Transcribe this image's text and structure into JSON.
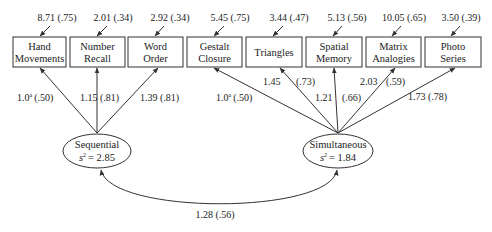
{
  "diagram": {
    "type": "structural-equation-model",
    "colors": {
      "stroke": "#333333",
      "text": "#222222",
      "background": "#ffffff"
    },
    "indicators": [
      {
        "id": "hand-movements",
        "label_lines": [
          "Hand",
          "Movements"
        ],
        "error": "8.71 (.75)",
        "factor": "sequential",
        "loading": "1.0ª (.50)",
        "loading_value": "1.0",
        "loading_sup": "a",
        "loading_std": "(.50)"
      },
      {
        "id": "number-recall",
        "label_lines": [
          "Number",
          "Recall"
        ],
        "error": "2.01 (.34)",
        "factor": "sequential",
        "loading": "1.15 (.81)",
        "loading_value": "1.15",
        "loading_std": "(.81)"
      },
      {
        "id": "word-order",
        "label_lines": [
          "Word",
          "Order"
        ],
        "error": "2.92 (.34)",
        "factor": "sequential",
        "loading": "1.39 (.81)",
        "loading_value": "1.39",
        "loading_std": "(.81)"
      },
      {
        "id": "gestalt-closure",
        "label_lines": [
          "Gestalt",
          "Closure"
        ],
        "error": "5.45 (.75)",
        "factor": "simultaneous",
        "loading": "1.0ª (.50)",
        "loading_value": "1.0",
        "loading_sup": "a",
        "loading_std": "(.50)"
      },
      {
        "id": "triangles",
        "label_lines": [
          "Triangles"
        ],
        "error": "3.44 (.47)",
        "factor": "simultaneous",
        "loading": "1.45 (.73)",
        "loading_value": "1.45",
        "loading_std": "(.73)"
      },
      {
        "id": "spatial-memory",
        "label_lines": [
          "Spatial",
          "Memory"
        ],
        "error": "5.13 (.56)",
        "factor": "simultaneous",
        "loading": "1.21 (.66)",
        "loading_value": "1.21",
        "loading_std": "(.66)"
      },
      {
        "id": "matrix-analogies",
        "label_lines": [
          "Matrix",
          "Analogies"
        ],
        "error": "10.05 (.65)",
        "factor": "simultaneous",
        "loading": "2.03 (.59)",
        "loading_value": "2.03",
        "loading_std": "(.59)"
      },
      {
        "id": "photo-series",
        "label_lines": [
          "Photo",
          "Series"
        ],
        "error": "3.50 (.39)",
        "factor": "simultaneous",
        "loading": "1.73 (.78)",
        "loading_value": "1.73",
        "loading_std": "(.78)"
      }
    ],
    "factors": [
      {
        "id": "sequential",
        "name": "Sequential",
        "variance_symbol": "s",
        "variance_exp": "2",
        "variance_value": "= 2.85"
      },
      {
        "id": "simultaneous",
        "name": "Simultaneous",
        "variance_symbol": "s",
        "variance_exp": "2",
        "variance_value": "= 1.84"
      }
    ],
    "covariance": {
      "between": [
        "sequential",
        "simultaneous"
      ],
      "label": "1.28 (.56)"
    }
  }
}
